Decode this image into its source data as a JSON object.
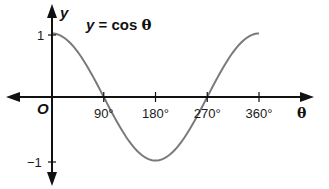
{
  "chart_data": {
    "type": "line",
    "title": "y = cos θ",
    "title_parts": {
      "lhs": "y",
      "rhs": " = cos ",
      "var": "θ"
    },
    "xlabel": "θ",
    "ylabel": "y",
    "origin_label": "O",
    "x_ticks": [
      "90°",
      "180°",
      "270°",
      "360°"
    ],
    "x_tick_values": [
      90,
      180,
      270,
      360
    ],
    "y_ticks": [
      "1",
      "−1"
    ],
    "y_tick_values": [
      1,
      -1
    ],
    "xlim": [
      0,
      360
    ],
    "ylim": [
      -1,
      1
    ],
    "grid": false,
    "legend": "none",
    "series": [
      {
        "name": "cos θ",
        "x": [
          0,
          45,
          90,
          135,
          180,
          225,
          270,
          315,
          360
        ],
        "values": [
          1,
          0.707,
          0,
          -0.707,
          -1,
          -0.707,
          0,
          0.707,
          1
        ],
        "color": "#7a7a7a"
      }
    ],
    "colors": {
      "axis": "#111111",
      "curve": "#7a7a7a"
    }
  }
}
